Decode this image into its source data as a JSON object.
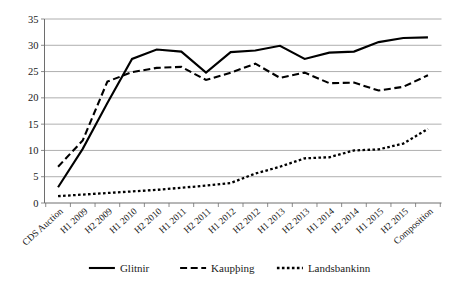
{
  "chart_data": {
    "type": "line",
    "title": "",
    "subtitle": "",
    "xlabel": "",
    "ylabel": "",
    "ylim": [
      0,
      35
    ],
    "yticks": [
      0,
      5,
      10,
      15,
      20,
      25,
      30,
      35
    ],
    "grid": true,
    "legend_position": "bottom",
    "categories": [
      "CDS Auction",
      "H1 2009",
      "H2 2009",
      "H1 2010",
      "H2 2010",
      "H1 2011",
      "H2 2011",
      "H1 2012",
      "H2 2012",
      "H1 2013",
      "H2 2013",
      "H1 2014",
      "H2 2014",
      "H1 2015",
      "H2 2015",
      "Composition"
    ],
    "series": [
      {
        "name": "Glitnir",
        "style": "solid",
        "color": "#000000",
        "values": [
          3.0,
          10.3,
          19.0,
          27.4,
          29.2,
          28.8,
          24.8,
          28.7,
          29.0,
          29.9,
          27.4,
          28.6,
          28.8,
          30.6,
          31.4,
          31.5
        ]
      },
      {
        "name": "Kaupþing",
        "style": "dashed",
        "color": "#000000",
        "values": [
          6.9,
          11.9,
          23.1,
          24.9,
          25.7,
          25.9,
          23.4,
          24.8,
          26.5,
          23.8,
          24.8,
          22.8,
          22.9,
          21.4,
          22.1,
          24.3
        ]
      },
      {
        "name": "Landsbankinn",
        "style": "dotted",
        "color": "#000000",
        "values": [
          1.3,
          1.6,
          1.9,
          2.2,
          2.5,
          2.9,
          3.3,
          3.8,
          5.6,
          6.9,
          8.5,
          8.7,
          10.0,
          10.2,
          11.3,
          14.1
        ]
      }
    ]
  },
  "legend": {
    "items": [
      {
        "label": "Glitnir",
        "style": "solid"
      },
      {
        "label": "Kaupþing",
        "style": "dashed"
      },
      {
        "label": "Landsbankinn",
        "style": "dotted"
      }
    ]
  }
}
